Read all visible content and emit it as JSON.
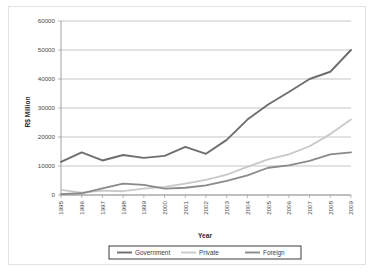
{
  "chart_data": {
    "type": "line",
    "title": "",
    "xlabel": "Year",
    "ylabel": "R$ Million",
    "grid": true,
    "legend_position": "bottom",
    "x": [
      1995,
      1996,
      1997,
      1998,
      1999,
      2000,
      2001,
      2002,
      2003,
      2004,
      2005,
      2006,
      2007,
      2008,
      2009
    ],
    "categories": [
      "1995",
      "1996",
      "1997",
      "1998",
      "1999",
      "2000",
      "2001",
      "2002",
      "2003",
      "2004",
      "2005",
      "2006",
      "2007",
      "2008",
      "2009"
    ],
    "xlim": [
      1995,
      2009
    ],
    "ylim": [
      0,
      60000
    ],
    "yticks": [
      0,
      10000,
      20000,
      30000,
      40000,
      50000,
      60000
    ],
    "ytick_labels": [
      "0",
      "10000",
      "20000",
      "30000",
      "40000",
      "50000",
      "60000"
    ],
    "series": [
      {
        "name": "Government",
        "color": "#6e6e6e",
        "values": [
          11400,
          14700,
          11900,
          13800,
          12800,
          13500,
          16600,
          14200,
          19000,
          26000,
          31200,
          35500,
          40000,
          42500,
          50000
        ]
      },
      {
        "name": "Private",
        "color": "#c9c9c9",
        "values": [
          1800,
          800,
          1500,
          1300,
          2200,
          2800,
          3900,
          5200,
          7000,
          9700,
          12300,
          14000,
          16800,
          21000,
          26000
        ]
      },
      {
        "name": "Foreign",
        "color": "#8a8a8a",
        "values": [
          300,
          600,
          2300,
          3900,
          3500,
          2200,
          2500,
          3300,
          4900,
          6800,
          9400,
          10200,
          11800,
          14000,
          14700
        ]
      }
    ]
  },
  "axis": {
    "x_title": "Year",
    "y_title": "R$ Million"
  },
  "legend": {
    "entries": [
      {
        "label": "Government",
        "color": "#6e6e6e"
      },
      {
        "label": "Private",
        "color": "#c9c9c9"
      },
      {
        "label": "Foreign",
        "color": "#8a8a8a"
      }
    ]
  }
}
